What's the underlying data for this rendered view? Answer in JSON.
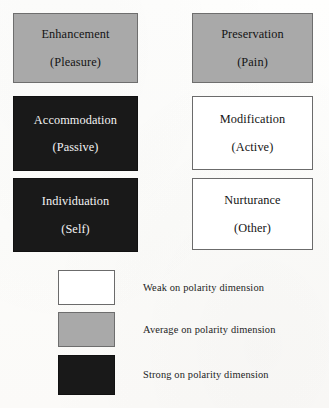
{
  "figure": {
    "type": "matrix-diagram",
    "background_color": "#fdfdfc"
  },
  "matrix": {
    "cells": [
      {
        "name": "enhancement",
        "title": "Enhancement",
        "subtitle": "(Pleasure)",
        "shading": "average",
        "shading_label": "Average on polarity dimension",
        "fill_color": "#a9a9a9",
        "text_color": "#141414",
        "column": 1,
        "row": 1
      },
      {
        "name": "preservation",
        "title": "Preservation",
        "subtitle": "(Pain)",
        "shading": "average",
        "shading_label": "Average on polarity dimension",
        "fill_color": "#a9a9a9",
        "text_color": "#141414",
        "column": 2,
        "row": 1
      },
      {
        "name": "accommodation",
        "title": "Accommodation",
        "subtitle": "(Passive)",
        "shading": "strong",
        "shading_label": "Strong on polarity dimension",
        "fill_color": "#191919",
        "text_color": "#f3f3f3",
        "column": 1,
        "row": 2
      },
      {
        "name": "modification",
        "title": "Modification",
        "subtitle": "(Active)",
        "shading": "weak",
        "shading_label": "Weak on polarity dimension",
        "fill_color": "#ffffff",
        "text_color": "#141414",
        "column": 2,
        "row": 2
      },
      {
        "name": "individuation",
        "title": "Individuation",
        "subtitle": "(Self)",
        "shading": "strong",
        "shading_label": "Strong on polarity dimension",
        "fill_color": "#191919",
        "text_color": "#f3f3f3",
        "column": 1,
        "row": 3
      },
      {
        "name": "nurturance",
        "title": "Nurturance",
        "subtitle": "(Other)",
        "shading": "weak",
        "shading_label": "Weak on polarity dimension",
        "fill_color": "#ffffff",
        "text_color": "#141414",
        "column": 2,
        "row": 3
      }
    ]
  },
  "legend": {
    "items": [
      {
        "name": "weak",
        "label": "Weak on polarity dimension",
        "fill_color": "#ffffff",
        "border_color": "#6b6b6b"
      },
      {
        "name": "average",
        "label": "Average on polarity dimension",
        "fill_color": "#a9a9a9",
        "border_color": "#6e6e6e"
      },
      {
        "name": "strong",
        "label": "Strong on polarity dimension",
        "fill_color": "#191919",
        "border_color": "#111111"
      }
    ]
  }
}
